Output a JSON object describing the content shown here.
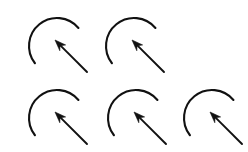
{
  "figure": {
    "background_color": "#ffffff",
    "stroke_color": "#111111",
    "width": 248,
    "height": 152,
    "symbol_count": 5,
    "symbol_name": "counterclockwise-arc-with-inward-arrow"
  },
  "symbol_geometry": {
    "arc": {
      "center_x": 44,
      "center_y": 40,
      "radius": 28,
      "start_angle_deg": 40,
      "end_angle_deg": 218,
      "sweep_direction": "counterclockwise",
      "gap_position": "lower-right",
      "stroke_width": 2.1
    },
    "arrow": {
      "tail_x": 74,
      "tail_y": 66,
      "tip_x": 42,
      "tip_y": 34,
      "direction": "up-left",
      "head_style": "filled-triangle",
      "head_length": 11,
      "head_width": 8,
      "stroke_width": 1.9
    }
  },
  "grid": {
    "rows": [
      {
        "row_index": 0,
        "label": "row-1",
        "symbols": [
          {
            "id": "symbol-1",
            "x": 13,
            "y": 6
          },
          {
            "id": "symbol-2",
            "x": 90,
            "y": 6
          }
        ]
      },
      {
        "row_index": 1,
        "label": "row-2",
        "symbols": [
          {
            "id": "symbol-3",
            "x": 13,
            "y": 78
          },
          {
            "id": "symbol-4",
            "x": 92,
            "y": 78
          },
          {
            "id": "symbol-5",
            "x": 168,
            "y": 78
          }
        ]
      }
    ]
  }
}
